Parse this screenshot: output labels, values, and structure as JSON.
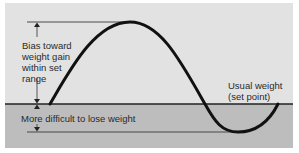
{
  "diagram": {
    "title": "",
    "labels": {
      "bias_line1": "Bias toward",
      "bias_line2": "weight gain",
      "bias_line3": "within set",
      "bias_line4": "range",
      "usual_line1": "Usual weight",
      "usual_line2": "(set point)",
      "difficult": "More difficult to lose  weight"
    },
    "colors": {
      "upper_background": "#e2e2e2",
      "lower_band": "#bdbdbd",
      "curve": "#111111",
      "lines": "#2b2b2b",
      "page": "#ffffff"
    },
    "curve_description": "Sinusoidal weight curve rising from set point to a peak, falling below set point to a trough, then returning toward set point"
  }
}
